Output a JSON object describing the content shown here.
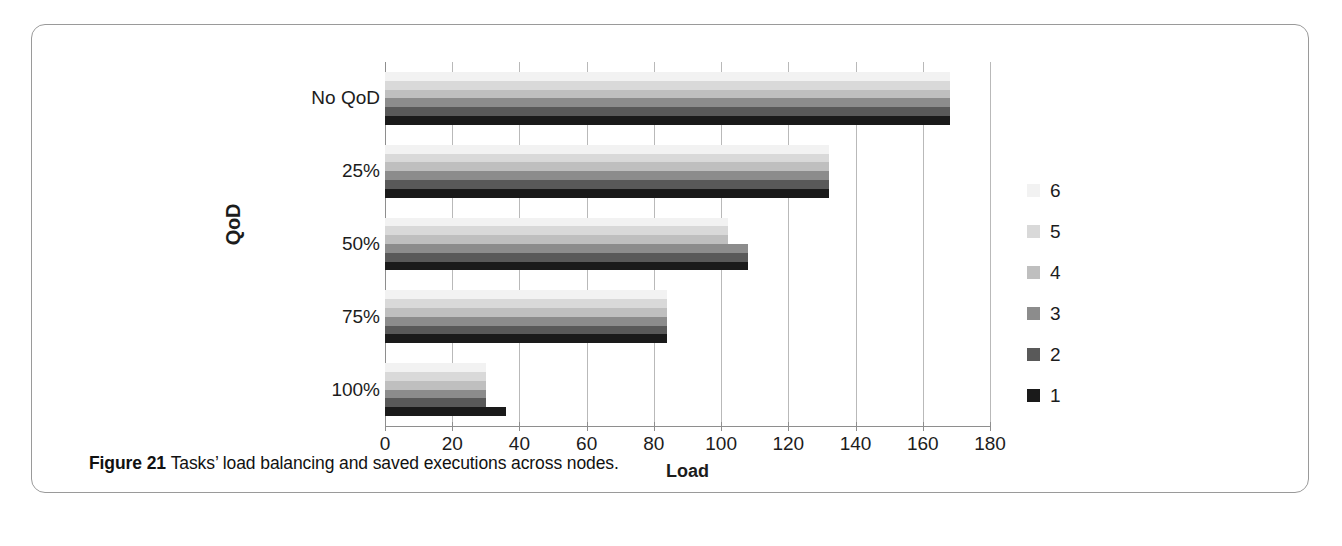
{
  "caption": {
    "figure_number": "Figure 21",
    "text": "Tasks’ load balancing and saved executions across nodes."
  },
  "chart_data": {
    "type": "bar",
    "orientation": "horizontal",
    "title": "",
    "xlabel": "Load",
    "ylabel": "QoD",
    "xlim": [
      0,
      180
    ],
    "xticks": [
      0,
      20,
      40,
      60,
      80,
      100,
      120,
      140,
      160,
      180
    ],
    "categories": [
      "No QoD",
      "25%",
      "50%",
      "75%",
      "100%"
    ],
    "grid": true,
    "legend_position": "right",
    "series": [
      {
        "name": "6",
        "color": "#f2f2f2",
        "values": [
          168,
          132,
          102,
          84,
          30
        ]
      },
      {
        "name": "5",
        "color": "#d9d9d9",
        "values": [
          168,
          132,
          102,
          84,
          30
        ]
      },
      {
        "name": "4",
        "color": "#bfbfbf",
        "values": [
          168,
          132,
          102,
          84,
          30
        ]
      },
      {
        "name": "3",
        "color": "#8c8c8c",
        "values": [
          168,
          132,
          108,
          84,
          30
        ]
      },
      {
        "name": "2",
        "color": "#595959",
        "values": [
          168,
          132,
          108,
          84,
          30
        ]
      },
      {
        "name": "1",
        "color": "#1a1a1a",
        "values": [
          168,
          132,
          108,
          84,
          36
        ]
      }
    ],
    "legend_entries": [
      "6",
      "5",
      "4",
      "3",
      "2",
      "1"
    ]
  }
}
